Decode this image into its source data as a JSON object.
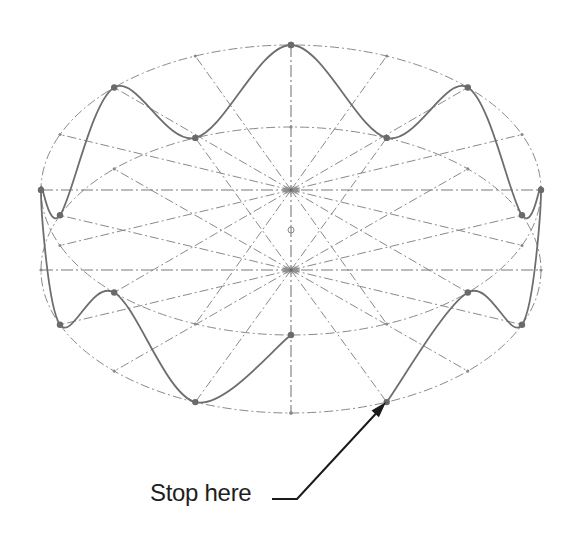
{
  "diagram": {
    "type": "geometric-construction",
    "colors": {
      "construction": "#8a8a8a",
      "curve": "#6e6e6e",
      "arrow": "#1a1a1a",
      "text": "#1e1e1e",
      "background": "#ffffff"
    },
    "upper_ellipse": {
      "cx": 291,
      "cy": 190,
      "rx": 250,
      "ry": 145
    },
    "lower_ellipse": {
      "cx": 291,
      "cy": 270,
      "rx": 250,
      "ry": 143
    },
    "divisions": 16,
    "vertical_axis": {
      "x": 291,
      "y1": 45,
      "y2": 413
    },
    "center_marker": {
      "x": 291,
      "y": 230,
      "r": 3
    },
    "curve_path": [
      {
        "ellipse": "upper",
        "angle": 270
      },
      {
        "ellipse": "lower",
        "angle": 247.5
      },
      {
        "ellipse": "upper",
        "angle": 225
      },
      {
        "ellipse": "lower",
        "angle": 202.5
      },
      {
        "ellipse": "upper",
        "angle": 180
      },
      {
        "ellipse": "lower",
        "angle": 157.5
      },
      {
        "ellipse": "upper",
        "angle": 135
      },
      {
        "ellipse": "lower",
        "angle": 112.5
      },
      {
        "ellipse": "upper",
        "angle": 90
      },
      {
        "ellipse": "lower",
        "angle": 67.5
      },
      {
        "ellipse": "upper",
        "angle": 45
      },
      {
        "ellipse": "lower",
        "angle": 22.5
      },
      {
        "ellipse": "upper",
        "angle": 0
      },
      {
        "ellipse": "lower",
        "angle": 337.5
      },
      {
        "ellipse": "upper",
        "angle": 315
      },
      {
        "ellipse": "lower",
        "angle": 292.5
      }
    ]
  },
  "callout": {
    "label": "Stop here",
    "underline": {
      "x1": 272,
      "x2": 297,
      "y": 499
    },
    "arrow_tip": {
      "x": 386,
      "y": 402
    }
  }
}
